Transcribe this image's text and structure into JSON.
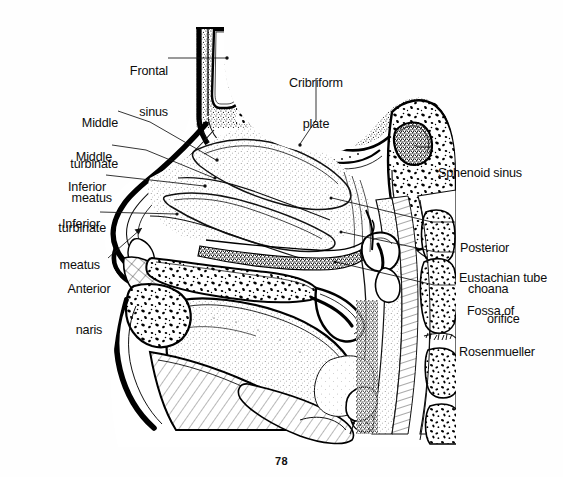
{
  "figure": {
    "page_number": "78",
    "ink_color": "#111111",
    "background_color": "#ffffff",
    "labels": [
      {
        "id": "frontal-sinus",
        "text": "Frontal\nsinus",
        "side": "left"
      },
      {
        "id": "middle-turbinate",
        "text": "Middle\nturbinate",
        "side": "left"
      },
      {
        "id": "middle-meatus",
        "text": "Middle\nmeatus",
        "side": "left"
      },
      {
        "id": "inferior-turbinate",
        "text": "Inferior\nturbinate",
        "side": "left"
      },
      {
        "id": "inferior-meatus",
        "text": "Inferior\nmeatus",
        "side": "left"
      },
      {
        "id": "anterior-naris",
        "text": "Anterior\nnaris",
        "side": "left"
      },
      {
        "id": "cribriform-plate",
        "text": "Cribriform\nplate",
        "side": "top"
      },
      {
        "id": "sphenoid-sinus",
        "text": "Sphenoid sinus",
        "side": "right"
      },
      {
        "id": "posterior-choana",
        "text": "Posterior\nchoana",
        "side": "right"
      },
      {
        "id": "eustachian-tube",
        "text": "Eustachian tube\norifice",
        "side": "right"
      },
      {
        "id": "fossa-rosenmueller",
        "text": "Fossa of\nRosenmueller",
        "side": "right"
      }
    ],
    "label_text": {
      "frontal_sinus_l1": "Frontal",
      "frontal_sinus_l2": "sinus",
      "middle_turbinate_l1": "Middle",
      "middle_turbinate_l2": "turbinate",
      "middle_meatus_l1": "Middle",
      "middle_meatus_l2": "meatus",
      "inferior_turbinate_l1": "Inferior",
      "inferior_turbinate_l2": "turbinate",
      "inferior_meatus_l1": "Inferior",
      "inferior_meatus_l2": "meatus",
      "anterior_naris_l1": "Anterior",
      "anterior_naris_l2": "naris",
      "cribriform_plate_l1": "Cribriform",
      "cribriform_plate_l2": "plate",
      "sphenoid_sinus_l1": "Sphenoid sinus",
      "posterior_choana_l1": "Posterior",
      "posterior_choana_l2": "choana",
      "eustachian_tube_l1": "Eustachian tube",
      "eustachian_tube_l2": "orifice",
      "fossa_rosenmueller_l1": "Fossa of",
      "fossa_rosenmueller_l2": "Rosenmueller"
    }
  }
}
